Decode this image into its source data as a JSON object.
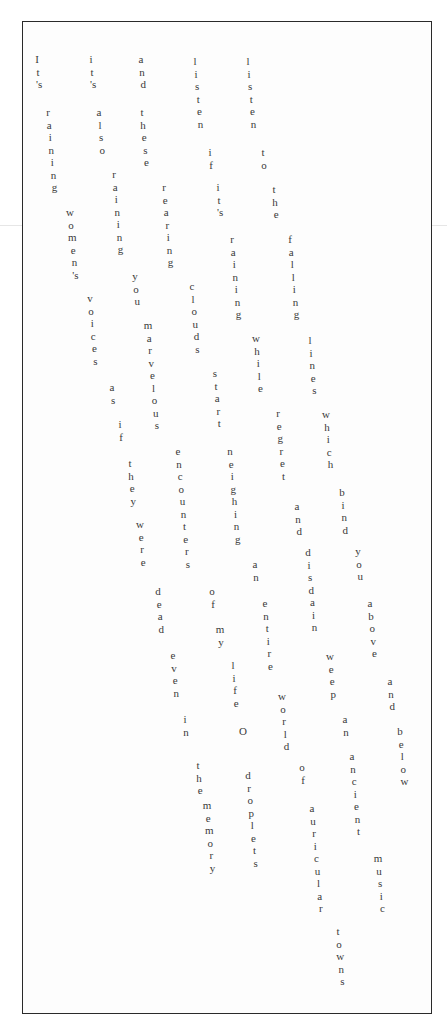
{
  "poem": {
    "title": "It's Raining",
    "letter_step": 12.5,
    "drift_per_letter": 1.1,
    "lines": [
      {
        "text": "It's raining women's voices as if they were dead even in the memory",
        "words": [
          {
            "w": "It's",
            "x": 37,
            "y": 60
          },
          {
            "w": "raining",
            "x": 48,
            "y": 113
          },
          {
            "w": "women's",
            "x": 70,
            "y": 213
          },
          {
            "w": "voices",
            "x": 90,
            "y": 299
          },
          {
            "w": "as",
            "x": 112,
            "y": 388
          },
          {
            "w": "if",
            "x": 120,
            "y": 425
          },
          {
            "w": "they",
            "x": 130,
            "y": 464
          },
          {
            "w": "were",
            "x": 140,
            "y": 525
          },
          {
            "w": "dead",
            "x": 158,
            "y": 592
          },
          {
            "w": "even",
            "x": 173,
            "y": 656
          },
          {
            "w": "in",
            "x": 185,
            "y": 720
          },
          {
            "w": "the",
            "x": 198,
            "y": 766
          },
          {
            "w": "memory",
            "x": 207,
            "y": 806
          }
        ]
      },
      {
        "text": "it's also raining you marvelous encounters of my life O droplets",
        "words": [
          {
            "w": "it's",
            "x": 91,
            "y": 60
          },
          {
            "w": "also",
            "x": 99,
            "y": 113
          },
          {
            "w": "raining",
            "x": 114,
            "y": 175
          },
          {
            "w": "you",
            "x": 135,
            "y": 277
          },
          {
            "w": "marvelous",
            "x": 148,
            "y": 326
          },
          {
            "w": "encounters",
            "x": 178,
            "y": 452
          },
          {
            "w": "of",
            "x": 212,
            "y": 592
          },
          {
            "w": "my",
            "x": 220,
            "y": 630
          },
          {
            "w": "life",
            "x": 233,
            "y": 666
          },
          {
            "w": "O",
            "x": 243,
            "y": 732
          },
          {
            "w": "droplets",
            "x": 248,
            "y": 776
          }
        ]
      },
      {
        "text": "and these rearing clouds start neighing an entire world of auricular towns",
        "words": [
          {
            "w": "and",
            "x": 141,
            "y": 60
          },
          {
            "w": "these",
            "x": 142,
            "y": 113
          },
          {
            "w": "rearing",
            "x": 164,
            "y": 188
          },
          {
            "w": "clouds",
            "x": 192,
            "y": 287
          },
          {
            "w": "start",
            "x": 215,
            "y": 374
          },
          {
            "w": "neighing",
            "x": 230,
            "y": 452
          },
          {
            "w": "an",
            "x": 255,
            "y": 565
          },
          {
            "w": "entire",
            "x": 265,
            "y": 604
          },
          {
            "w": "world",
            "x": 282,
            "y": 697
          },
          {
            "w": "of",
            "x": 302,
            "y": 768
          },
          {
            "w": "auricular",
            "x": 312,
            "y": 809
          },
          {
            "w": "towns",
            "x": 338,
            "y": 932
          }
        ]
      },
      {
        "text": "listen if it's raining while regret and disdain weep an ancient music",
        "words": [
          {
            "w": "listen",
            "x": 195,
            "y": 62
          },
          {
            "w": "if",
            "x": 210,
            "y": 153
          },
          {
            "w": "it's",
            "x": 218,
            "y": 188
          },
          {
            "w": "raining",
            "x": 232,
            "y": 240
          },
          {
            "w": "while",
            "x": 256,
            "y": 339
          },
          {
            "w": "regret",
            "x": 278,
            "y": 414
          },
          {
            "w": "and",
            "x": 297,
            "y": 507
          },
          {
            "w": "disdain",
            "x": 308,
            "y": 553
          },
          {
            "w": "weep",
            "x": 330,
            "y": 657
          },
          {
            "w": "an",
            "x": 345,
            "y": 720
          },
          {
            "w": "ancient",
            "x": 352,
            "y": 757
          },
          {
            "w": "music",
            "x": 378,
            "y": 859
          }
        ]
      },
      {
        "text": "listen to the falling lines which bind you above and below",
        "words": [
          {
            "w": "listen",
            "x": 248,
            "y": 62
          },
          {
            "w": "to",
            "x": 263,
            "y": 153
          },
          {
            "w": "the",
            "x": 274,
            "y": 190
          },
          {
            "w": "falling",
            "x": 290,
            "y": 240
          },
          {
            "w": "lines",
            "x": 310,
            "y": 341
          },
          {
            "w": "which",
            "x": 326,
            "y": 415
          },
          {
            "w": "bind",
            "x": 342,
            "y": 493
          },
          {
            "w": "you",
            "x": 358,
            "y": 552
          },
          {
            "w": "above",
            "x": 370,
            "y": 604
          },
          {
            "w": "and",
            "x": 390,
            "y": 682
          },
          {
            "w": "below",
            "x": 400,
            "y": 732
          }
        ]
      }
    ]
  }
}
